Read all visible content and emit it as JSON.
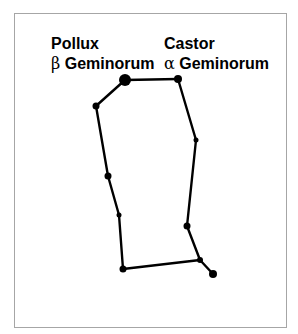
{
  "diagram": {
    "frame_border_color": "#a6a6a6",
    "line_color": "#000000",
    "labels": {
      "pollux": {
        "name": "Pollux",
        "greek": "β",
        "designation": "Geminorum"
      },
      "castor": {
        "name": "Castor",
        "greek": "α",
        "designation": "Geminorum"
      }
    },
    "stars": [
      {
        "id": "pollux",
        "x": 125,
        "y": 80,
        "r": 6
      },
      {
        "id": "castor",
        "x": 178,
        "y": 79,
        "r": 4
      },
      {
        "id": "l1",
        "x": 96,
        "y": 106,
        "r": 3.5
      },
      {
        "id": "l2",
        "x": 108,
        "y": 176,
        "r": 3.5
      },
      {
        "id": "l3",
        "x": 119,
        "y": 215,
        "r": 2.5
      },
      {
        "id": "l4",
        "x": 123,
        "y": 269,
        "r": 3.5
      },
      {
        "id": "r1",
        "x": 196,
        "y": 140,
        "r": 2.5
      },
      {
        "id": "r2",
        "x": 187,
        "y": 226,
        "r": 3.5
      },
      {
        "id": "r3",
        "x": 200,
        "y": 260,
        "r": 3
      },
      {
        "id": "tip",
        "x": 213,
        "y": 274,
        "r": 4
      }
    ],
    "edges": [
      [
        "pollux",
        "castor"
      ],
      [
        "pollux",
        "l1"
      ],
      [
        "l1",
        "l2"
      ],
      [
        "l2",
        "l3"
      ],
      [
        "l3",
        "l4"
      ],
      [
        "l4",
        "r3"
      ],
      [
        "castor",
        "r1"
      ],
      [
        "r1",
        "r2"
      ],
      [
        "r2",
        "r3"
      ],
      [
        "r3",
        "tip"
      ]
    ]
  }
}
